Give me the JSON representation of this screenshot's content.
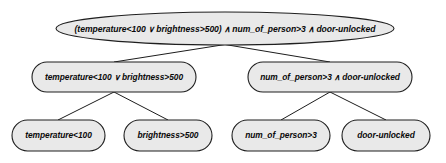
{
  "diagram": {
    "type": "expression-parse-tree",
    "title": "",
    "operators": {
      "and": "∧",
      "or": "∨"
    },
    "colors": {
      "node_fill": "#e9e9e9",
      "node_stroke": "#1f1f1f",
      "edge_stroke": "#1c1c1c",
      "text": "#0a0a0a",
      "background": "#ffffff"
    },
    "levels": [
      {
        "level": 0,
        "nodes": [
          {
            "id": "root",
            "shape": "ellipse",
            "text": "(temperature<100 ∨ brightness>500) ∧ num_of_person>3 ∧ door-unlocked",
            "parts": {
              "open_paren": "(",
              "left_operand": "temperature<100",
              "inner_operator": "∨",
              "right_operand": "brightness>500",
              "close_paren": ")",
              "operator_1": "∧",
              "operand_2": "num_of_person>3",
              "operator_2": "∧",
              "operand_3": "door-unlocked"
            }
          }
        ]
      },
      {
        "level": 1,
        "nodes": [
          {
            "id": "mid-left",
            "shape": "rounded-rect",
            "text": "temperature<100 ∨ brightness>500",
            "parts": {
              "left_operand": "temperature<100",
              "operator": "∨",
              "right_operand": "brightness>500"
            }
          },
          {
            "id": "mid-right",
            "shape": "rounded-rect",
            "text": "num_of_person>3 ∧ door-unlocked",
            "parts": {
              "left_operand": "num_of_person>3",
              "operator": "∧",
              "right_operand": "door-unlocked"
            }
          }
        ]
      },
      {
        "level": 2,
        "nodes": [
          {
            "id": "leaf-1",
            "shape": "rounded-rect",
            "text": "temperature<100"
          },
          {
            "id": "leaf-2",
            "shape": "rounded-rect",
            "text": "brightness>500"
          },
          {
            "id": "leaf-3",
            "shape": "rounded-rect",
            "text": "num_of_person>3"
          },
          {
            "id": "leaf-4",
            "shape": "rounded-rect",
            "text": "door-unlocked"
          }
        ]
      }
    ]
  }
}
